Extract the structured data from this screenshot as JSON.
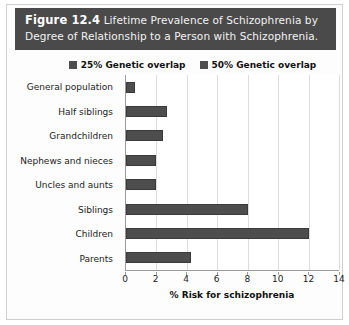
{
  "figure": {
    "number": "Figure 12.4",
    "caption": "Lifetime Prevalence of Schizophrenia by Degree of Relationship to a Person with Schizophrenia."
  },
  "legend": {
    "position": "top-center",
    "entries": [
      {
        "label": "25% Genetic overlap",
        "color": "#4d4d4d"
      },
      {
        "label": "50% Genetic overlap",
        "color": "#4d4d4d"
      }
    ]
  },
  "chart_data": {
    "type": "bar",
    "orientation": "horizontal",
    "title": "Lifetime Prevalence of Schizophrenia by Degree of Relationship to a Person with Schizophrenia.",
    "xlabel": "% Risk for schizophrenia",
    "ylabel": "",
    "xlim": [
      0,
      14
    ],
    "xticks": [
      0,
      2,
      4,
      6,
      8,
      10,
      12,
      14
    ],
    "grid": true,
    "legend_position": "top-center",
    "categories": [
      "General population",
      "Half siblings",
      "Grandchildren",
      "Nephews and nieces",
      "Uncles and aunts",
      "Siblings",
      "Children",
      "Parents"
    ],
    "values": [
      0.6,
      2.7,
      2.4,
      2.0,
      2.0,
      8.0,
      12.0,
      4.3
    ],
    "series": [
      {
        "name": "% Risk for schizophrenia",
        "values": [
          0.6,
          2.7,
          2.4,
          2.0,
          2.0,
          8.0,
          12.0,
          4.3
        ]
      }
    ],
    "bar_colors": [
      "#4d4d4d",
      "#4d4d4d",
      "#4d4d4d",
      "#4d4d4d",
      "#4d4d4d",
      "#4d4d4d",
      "#4d4d4d",
      "#4d4d4d"
    ]
  },
  "colors": {
    "banner_background": "#4a4a4a",
    "banner_text": "#ffffff",
    "bar": "#4d4d4d",
    "gridline": "#dcdcdc",
    "axis": "#9a9a9a",
    "figure_border": "#cfcfcf"
  }
}
